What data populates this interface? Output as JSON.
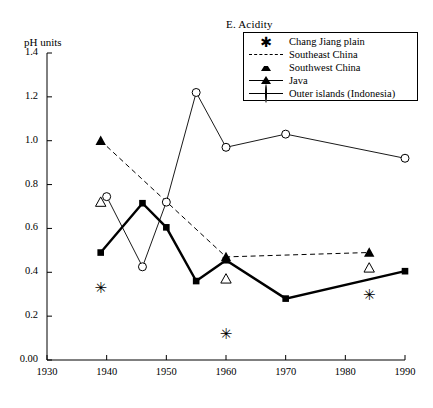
{
  "chart_title": "E. Acidity",
  "axis": {
    "ylabel": "pH units",
    "xlabel": "",
    "yticks": [
      "0.00",
      "0.2",
      "0.4",
      "0.6",
      "0.8",
      "1.0",
      "1.2",
      "1.4"
    ],
    "xticks": [
      "1930",
      "1940",
      "1950",
      "1960",
      "1970",
      "1980",
      "1990"
    ]
  },
  "legend": {
    "items": [
      {
        "label": "Chang Jiang plain",
        "key": "asterisk-marker"
      },
      {
        "label": "Southeast China",
        "key": "dashed-line-filled-triangle"
      },
      {
        "label": "Southwest China",
        "key": "open-triangle-marker"
      },
      {
        "label": "Java",
        "key": "thick-line-filled-square"
      },
      {
        "label": "Outer islands (Indonesia)",
        "key": "thin-line-open-circle"
      }
    ]
  },
  "chart_data": {
    "type": "line",
    "title": "E. Acidity",
    "xlabel": "",
    "ylabel": "pH units",
    "xlim": [
      1930,
      1990
    ],
    "ylim": [
      0.0,
      1.4
    ],
    "grid": false,
    "legend_position": "top-right",
    "series": [
      {
        "name": "Chang Jiang plain",
        "marker": "asterisk",
        "line": "none",
        "points": [
          {
            "x": 1939,
            "y": 0.33
          },
          {
            "x": 1960,
            "y": 0.12
          },
          {
            "x": 1984,
            "y": 0.3
          }
        ]
      },
      {
        "name": "Southeast China",
        "marker": "filled-triangle",
        "line": "dashed",
        "points": [
          {
            "x": 1939,
            "y": 1.0
          },
          {
            "x": 1960,
            "y": 0.47
          },
          {
            "x": 1984,
            "y": 0.49
          }
        ]
      },
      {
        "name": "Southwest China",
        "marker": "open-triangle",
        "line": "none",
        "points": [
          {
            "x": 1939,
            "y": 0.72
          },
          {
            "x": 1960,
            "y": 0.37
          },
          {
            "x": 1984,
            "y": 0.42
          }
        ]
      },
      {
        "name": "Java",
        "marker": "filled-square",
        "line": "solid-thick",
        "points": [
          {
            "x": 1939,
            "y": 0.49
          },
          {
            "x": 1946,
            "y": 0.715
          },
          {
            "x": 1950,
            "y": 0.605
          },
          {
            "x": 1955,
            "y": 0.36
          },
          {
            "x": 1960,
            "y": 0.455
          },
          {
            "x": 1970,
            "y": 0.28
          },
          {
            "x": 1990,
            "y": 0.405
          }
        ]
      },
      {
        "name": "Outer islands (Indonesia)",
        "marker": "open-circle",
        "line": "solid-thin",
        "points": [
          {
            "x": 1940,
            "y": 0.745
          },
          {
            "x": 1946,
            "y": 0.425
          },
          {
            "x": 1950,
            "y": 0.72
          },
          {
            "x": 1955,
            "y": 1.22
          },
          {
            "x": 1960,
            "y": 0.97
          },
          {
            "x": 1970,
            "y": 1.03
          },
          {
            "x": 1990,
            "y": 0.92
          }
        ]
      }
    ]
  }
}
